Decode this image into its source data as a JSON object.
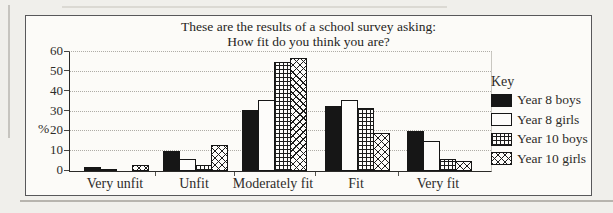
{
  "title": {
    "line1": "These are the results of a school survey asking:",
    "line2": "How fit do you think you are?"
  },
  "legend": {
    "title": "Key"
  },
  "colors": {
    "ink": "#161616",
    "panel_background": "#fcfbf8",
    "page_background": "#f0efeb",
    "gridline": "#aeaca6"
  },
  "chart_data": {
    "type": "bar",
    "title": "These are the results of a school survey asking: How fit do you think you are?",
    "categories": [
      "Very unfit",
      "Unfit",
      "Moderately fit",
      "Fit",
      "Very fit"
    ],
    "series": [
      {
        "name": "Year 8 boys",
        "pattern": "solid-black",
        "values": [
          2,
          10,
          31,
          33,
          20
        ]
      },
      {
        "name": "Year 8 girls",
        "pattern": "white",
        "values": [
          1,
          6,
          36,
          36,
          15
        ]
      },
      {
        "name": "Year 10 boys",
        "pattern": "grid",
        "values": [
          0,
          3,
          55,
          32,
          6
        ]
      },
      {
        "name": "Year 10 girls",
        "pattern": "crosshatch",
        "values": [
          3,
          13,
          57,
          19,
          5
        ]
      }
    ],
    "xlabel": "",
    "ylabel": "%",
    "ylim": [
      0,
      60
    ],
    "ystep": 10,
    "ytick_labels": [
      "0",
      "10",
      "20",
      "30",
      "40",
      "50",
      "60"
    ],
    "grid": true,
    "legend_position": "right"
  }
}
